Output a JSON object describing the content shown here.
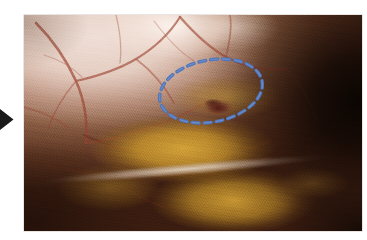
{
  "figure": {
    "kind": "laparoscopic-photograph",
    "canvas": {
      "width": 367,
      "height": 240,
      "background": "#ffffff"
    },
    "photo": {
      "name": "intraoperative-laparoscopic-view",
      "x": 24,
      "y": 15,
      "width": 338,
      "height": 216,
      "description": "Intra-abdominal laparoscopic view showing pale peritoneum with vascular markings at upper left, golden-yellow adipose tissue across the centre and lower field, and a darkened recess at the right.",
      "regions": [
        {
          "name": "pale-peritoneum",
          "label": "Pale peritoneal surface",
          "color": "#e8d2c7"
        },
        {
          "name": "specular-highlight",
          "label": "Light reflection",
          "color": "#fff8f0"
        },
        {
          "name": "vascular-network",
          "label": "Subserosal vessels",
          "color": "#8c3a28"
        },
        {
          "name": "adipose-tissue",
          "label": "Golden adipose tissue",
          "color": "#c8922c"
        },
        {
          "name": "fascial-band",
          "label": "Pale fascial band",
          "color": "#e2d4c8"
        },
        {
          "name": "dark-recess",
          "label": "Shadowed recess",
          "color": "#140804"
        },
        {
          "name": "lesion",
          "label": "Central defect / lesion",
          "color": "#4e1a16"
        }
      ]
    },
    "annotations": {
      "arrow": {
        "name": "pointer-arrow",
        "shape": "solid-triangle",
        "direction": "right",
        "color": "#1a1a1a",
        "x": 0,
        "y": 108,
        "width": 14,
        "height": 23
      },
      "marker_ellipse": {
        "name": "region-of-interest-ellipse",
        "style": "dashed",
        "color": "#4f74ba",
        "stroke_width": 3.4,
        "dash": "7 5",
        "center_x": 211,
        "center_y": 91,
        "radius_x": 52,
        "radius_y": 31,
        "rotation_deg": -11
      }
    }
  }
}
